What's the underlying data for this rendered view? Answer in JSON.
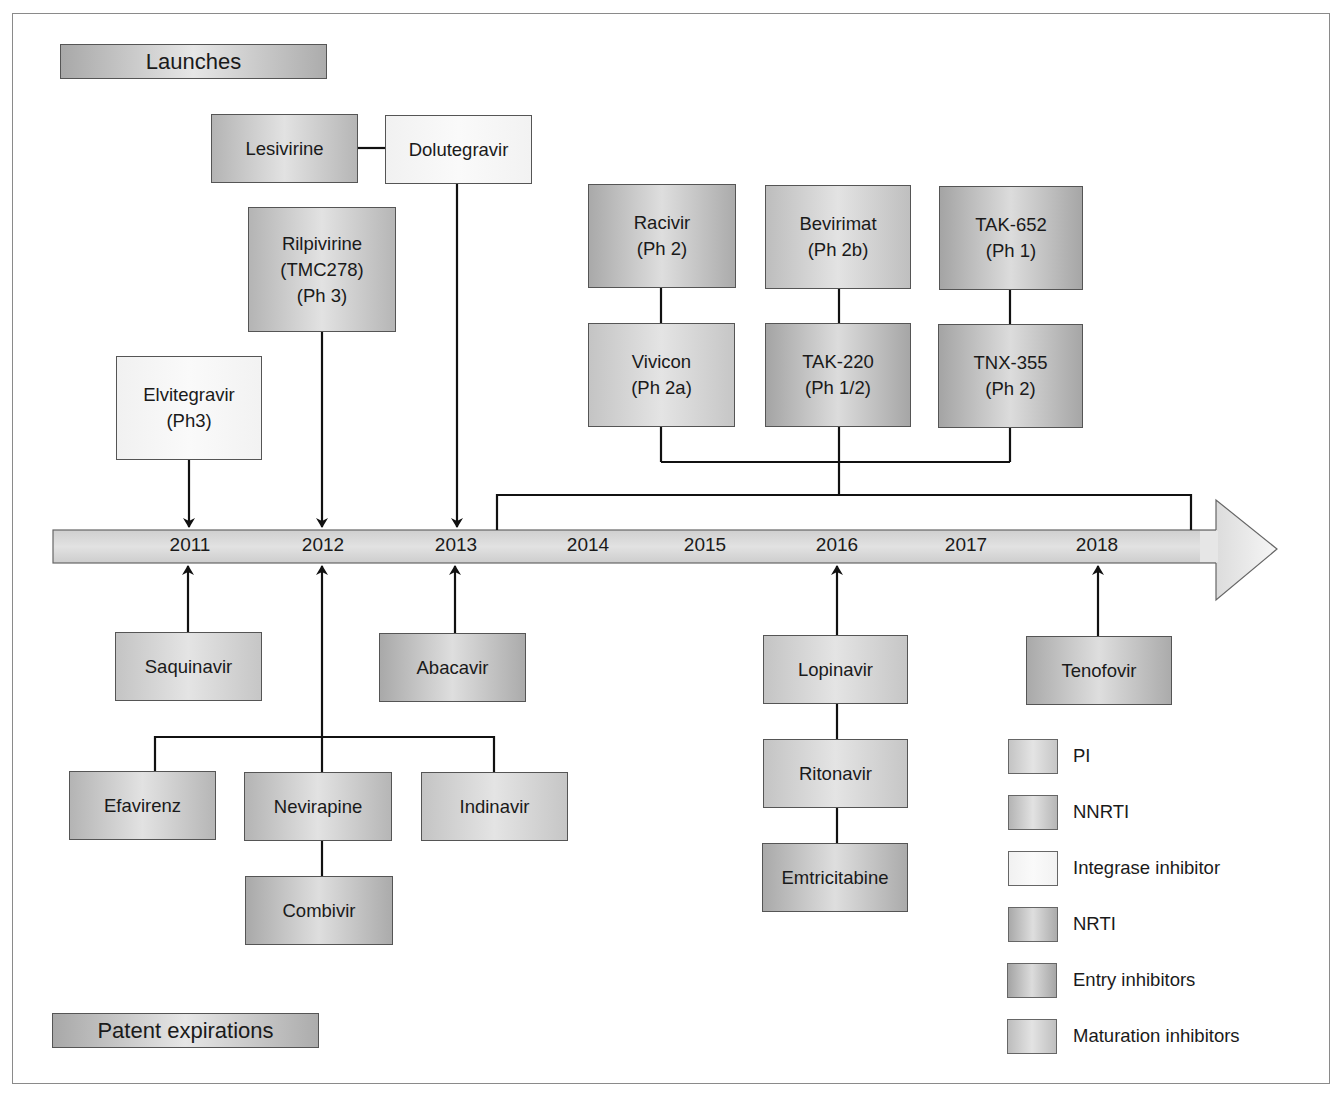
{
  "headers": {
    "launches": "Launches",
    "patent_expirations": "Patent expirations"
  },
  "timeline": {
    "years": [
      "2011",
      "2012",
      "2013",
      "2014",
      "2015",
      "2016",
      "2017",
      "2018"
    ]
  },
  "launches": {
    "lesivirine": "Lesivirine",
    "dolutegravir": "Dolutegravir",
    "rilpivirine": "Rilpivirine\n(TMC278)\n(Ph 3)",
    "elvitegravir": "Elvitegravir\n(Ph3)",
    "racivir": "Racivir\n(Ph 2)",
    "bevirimat": "Bevirimat\n(Ph 2b)",
    "tak652": "TAK-652\n(Ph 1)",
    "vivicon": "Vivicon\n(Ph 2a)",
    "tak220": "TAK-220\n(Ph 1/2)",
    "tnx355": "TNX-355\n(Ph 2)"
  },
  "expirations": {
    "saquinavir": "Saquinavir",
    "abacavir": "Abacavir",
    "efavirenz": "Efavirenz",
    "nevirapine": "Nevirapine",
    "indinavir": "Indinavir",
    "combivir": "Combivir",
    "lopinavir": "Lopinavir",
    "ritonavir": "Ritonavir",
    "emtricitabine": "Emtricitabine",
    "tenofovir": "Tenofovir"
  },
  "legend": [
    {
      "label": "PI"
    },
    {
      "label": "NNRTI"
    },
    {
      "label": "Integrase inhibitor"
    },
    {
      "label": "NRTI"
    },
    {
      "label": "Entry inhibitors"
    },
    {
      "label": "Maturation inhibitors"
    }
  ],
  "colors": {
    "line": "#111111",
    "timeline_fill": "#d6d6d6",
    "arrowhead_fill": "#f0f0f0",
    "border": "#555555"
  }
}
